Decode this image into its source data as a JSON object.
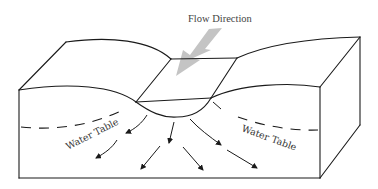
{
  "diagram": {
    "title": "Flow Direction",
    "labels": {
      "water_table_left": "Water Table",
      "water_table_right": "Water Table"
    },
    "colors": {
      "lines": "#1a1a1a",
      "flow_arrow": "#c0c0c0",
      "text": "#444444",
      "background": "#ffffff"
    },
    "elements": [
      "block diagram of ground",
      "stream channel",
      "groundwater flow arrows",
      "dashed water table line"
    ]
  }
}
